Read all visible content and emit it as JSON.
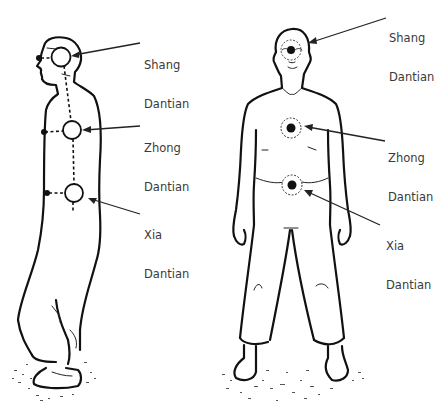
{
  "figures": [
    {
      "id": "side-view",
      "view": "profile",
      "points": [
        {
          "name": "Shang",
          "label_line1": "Shang",
          "label_line2": "Dantian"
        },
        {
          "name": "Zhong",
          "label_line1": "Zhong",
          "label_line2": "Dantian"
        },
        {
          "name": "Xia",
          "label_line1": "Xia",
          "label_line2": "Dantian"
        }
      ]
    },
    {
      "id": "front-view",
      "view": "frontal",
      "points": [
        {
          "name": "Shang",
          "label_line1": "Shang",
          "label_line2": "Dantian"
        },
        {
          "name": "Zhong",
          "label_line1": "Zhong",
          "label_line2": "Dantian"
        },
        {
          "name": "Xia",
          "label_line1": "Xia",
          "label_line2": "Dantian"
        }
      ]
    }
  ],
  "colors": {
    "line": "#111111",
    "label_text": "#3a3a3a",
    "background": "#ffffff"
  }
}
